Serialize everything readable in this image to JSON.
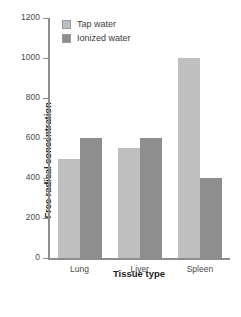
{
  "chart_data": {
    "type": "bar",
    "title": "",
    "xlabel": "Tissue type",
    "ylabel": "Free radical concentration",
    "categories": [
      "Lung",
      "Liver",
      "Spleen"
    ],
    "series": [
      {
        "name": "Tap water",
        "color": "#bfbfbf",
        "values": [
          495,
          550,
          1000
        ]
      },
      {
        "name": "Ionized water",
        "color": "#8e8e8e",
        "values": [
          600,
          600,
          400
        ]
      }
    ],
    "ylim": [
      0,
      1200
    ],
    "yticks": [
      0,
      200,
      400,
      600,
      800,
      1000,
      1200
    ],
    "ytick_labels": [
      "0",
      "200",
      "400",
      "600",
      "800",
      "1000",
      "1200"
    ],
    "grid": false,
    "legend_position": "top-left-inside"
  }
}
